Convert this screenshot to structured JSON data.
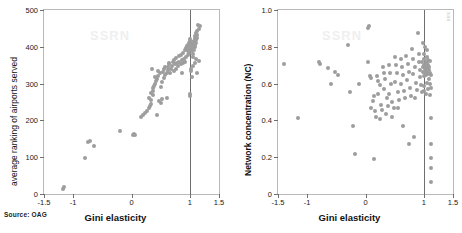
{
  "figure": {
    "source_note": "Source: OAG",
    "side_credit": "sas",
    "watermark_text": "SSRN"
  },
  "chart_data": [
    {
      "type": "scatter",
      "panel": "left",
      "title": "",
      "xlabel": "Gini elasticity",
      "ylabel": "average ranking of airports served",
      "xlim": [
        -1.5,
        1.5
      ],
      "ylim": [
        0,
        500
      ],
      "xticks": [
        -1.5,
        -1,
        0,
        1,
        1.5
      ],
      "xticklabels": [
        "-1.5",
        "-1",
        "0",
        "1",
        "1.5"
      ],
      "yticks": [
        0,
        100,
        200,
        300,
        400,
        500
      ],
      "yticklabels": [
        "0",
        "100",
        "200",
        "300",
        "400",
        "500"
      ],
      "grid": false,
      "legend": "none",
      "reference_line_x": 1,
      "marker_color": "#9d9d9d",
      "points": [
        [
          -1.18,
          14
        ],
        [
          -1.16,
          20
        ],
        [
          -0.8,
          98
        ],
        [
          -0.74,
          141
        ],
        [
          -0.71,
          143
        ],
        [
          -0.64,
          131
        ],
        [
          -0.2,
          171
        ],
        [
          0.02,
          160
        ],
        [
          0.04,
          163
        ],
        [
          0.06,
          159
        ],
        [
          0.16,
          209
        ],
        [
          0.2,
          215
        ],
        [
          0.23,
          219
        ],
        [
          0.27,
          226
        ],
        [
          0.3,
          233
        ],
        [
          0.31,
          240
        ],
        [
          0.33,
          245
        ],
        [
          0.3,
          262
        ],
        [
          0.34,
          256
        ],
        [
          0.36,
          268
        ],
        [
          0.33,
          275
        ],
        [
          0.36,
          281
        ],
        [
          0.37,
          289
        ],
        [
          0.35,
          341
        ],
        [
          0.38,
          293
        ],
        [
          0.4,
          300
        ],
        [
          0.42,
          306
        ],
        [
          0.44,
          312
        ],
        [
          0.41,
          318
        ],
        [
          0.46,
          322
        ],
        [
          0.45,
          333
        ],
        [
          0.48,
          328
        ],
        [
          0.43,
          215
        ],
        [
          0.47,
          252
        ],
        [
          0.5,
          246
        ],
        [
          0.52,
          258
        ],
        [
          0.5,
          290
        ],
        [
          0.53,
          303
        ],
        [
          0.55,
          316
        ],
        [
          0.54,
          332
        ],
        [
          0.56,
          340
        ],
        [
          0.58,
          323
        ],
        [
          0.6,
          329
        ],
        [
          0.57,
          346
        ],
        [
          0.62,
          336
        ],
        [
          0.63,
          345
        ],
        [
          0.6,
          262
        ],
        [
          0.64,
          352
        ],
        [
          0.66,
          330
        ],
        [
          0.68,
          339
        ],
        [
          0.65,
          356
        ],
        [
          0.7,
          347
        ],
        [
          0.72,
          333
        ],
        [
          0.71,
          360
        ],
        [
          0.74,
          352
        ],
        [
          0.76,
          341
        ],
        [
          0.73,
          365
        ],
        [
          0.78,
          356
        ],
        [
          0.8,
          348
        ],
        [
          0.77,
          370
        ],
        [
          0.82,
          360
        ],
        [
          0.84,
          352
        ],
        [
          0.81,
          374
        ],
        [
          0.86,
          364
        ],
        [
          0.88,
          356
        ],
        [
          0.85,
          379
        ],
        [
          0.9,
          368
        ],
        [
          0.87,
          330
        ],
        [
          0.92,
          360
        ],
        [
          0.89,
          384
        ],
        [
          0.94,
          372
        ],
        [
          0.91,
          390
        ],
        [
          0.96,
          377
        ],
        [
          0.93,
          396
        ],
        [
          0.98,
          382
        ],
        [
          0.95,
          401
        ],
        [
          0.97,
          388
        ],
        [
          0.99,
          394
        ],
        [
          0.96,
          406
        ],
        [
          1.0,
          399
        ],
        [
          0.98,
          411
        ],
        [
          1.01,
          403
        ],
        [
          1.0,
          416
        ],
        [
          1.02,
          408
        ],
        [
          1.01,
          421
        ],
        [
          1.03,
          412
        ],
        [
          1.02,
          333
        ],
        [
          1.03,
          317
        ],
        [
          1.0,
          273
        ],
        [
          1.01,
          265
        ],
        [
          1.04,
          396
        ],
        [
          1.05,
          402
        ],
        [
          1.03,
          388
        ],
        [
          1.06,
          380
        ],
        [
          1.05,
          372
        ],
        [
          1.07,
          392
        ],
        [
          1.04,
          405
        ],
        [
          1.08,
          399
        ],
        [
          1.06,
          410
        ],
        [
          1.09,
          404
        ],
        [
          1.07,
          417
        ],
        [
          1.1,
          411
        ],
        [
          1.08,
          424
        ],
        [
          1.11,
          418
        ],
        [
          1.09,
          430
        ],
        [
          1.12,
          425
        ],
        [
          1.1,
          437
        ],
        [
          1.13,
          432
        ],
        [
          1.12,
          443
        ],
        [
          1.15,
          449
        ],
        [
          1.17,
          456
        ],
        [
          1.14,
          460
        ],
        [
          1.13,
          330
        ],
        [
          1.16,
          362
        ],
        [
          1.11,
          366
        ],
        [
          1.08,
          356
        ],
        [
          1.05,
          347
        ],
        [
          1.02,
          339
        ]
      ]
    },
    {
      "type": "scatter",
      "panel": "right",
      "title": "",
      "xlabel": "Gini elasticity",
      "ylabel": "Network concentration (NC)",
      "xlim": [
        -1.5,
        1.5
      ],
      "ylim": [
        0,
        1.0
      ],
      "xticks": [
        -1.5,
        -1,
        0,
        1,
        1.5
      ],
      "xticklabels": [
        "-1.5",
        "-1",
        "0",
        "1",
        "1.5"
      ],
      "yticks": [
        0,
        0.2,
        0.4,
        0.6,
        0.8,
        1.0
      ],
      "yticklabels": [
        "0",
        "0.2",
        "0.4",
        "0.6",
        "0.8",
        "1.0"
      ],
      "grid": false,
      "legend": "none",
      "reference_line_x": 1,
      "marker_color": "#9d9d9d",
      "points": [
        [
          -1.4,
          0.705
        ],
        [
          -1.16,
          0.415
        ],
        [
          -0.8,
          0.72
        ],
        [
          -0.78,
          0.708
        ],
        [
          -0.64,
          0.685
        ],
        [
          -0.6,
          0.6
        ],
        [
          -0.52,
          0.665
        ],
        [
          -0.48,
          0.645
        ],
        [
          -0.3,
          0.81
        ],
        [
          -0.26,
          0.555
        ],
        [
          -0.22,
          0.37
        ],
        [
          -0.18,
          0.22
        ],
        [
          -0.12,
          0.6
        ],
        [
          0.05,
          0.9
        ],
        [
          0.06,
          0.915
        ],
        [
          0.04,
          0.72
        ],
        [
          0.08,
          0.64
        ],
        [
          0.1,
          0.63
        ],
        [
          0.12,
          0.505
        ],
        [
          0.14,
          0.53
        ],
        [
          0.1,
          0.47
        ],
        [
          0.16,
          0.45
        ],
        [
          0.18,
          0.42
        ],
        [
          0.15,
          0.19
        ],
        [
          0.2,
          0.64
        ],
        [
          0.22,
          0.615
        ],
        [
          0.24,
          0.59
        ],
        [
          0.21,
          0.545
        ],
        [
          0.26,
          0.485
        ],
        [
          0.28,
          0.455
        ],
        [
          0.25,
          0.41
        ],
        [
          0.3,
          0.69
        ],
        [
          0.32,
          0.66
        ],
        [
          0.34,
          0.625
        ],
        [
          0.31,
          0.57
        ],
        [
          0.36,
          0.52
        ],
        [
          0.38,
          0.48
        ],
        [
          0.35,
          0.435
        ],
        [
          0.4,
          0.7
        ],
        [
          0.42,
          0.655
        ],
        [
          0.44,
          0.6
        ],
        [
          0.41,
          0.545
        ],
        [
          0.46,
          0.5
        ],
        [
          0.48,
          0.465
        ],
        [
          0.45,
          0.42
        ],
        [
          0.5,
          0.745
        ],
        [
          0.52,
          0.7
        ],
        [
          0.54,
          0.66
        ],
        [
          0.51,
          0.61
        ],
        [
          0.56,
          0.555
        ],
        [
          0.58,
          0.51
        ],
        [
          0.55,
          0.47
        ],
        [
          0.6,
          0.735
        ],
        [
          0.62,
          0.69
        ],
        [
          0.64,
          0.645
        ],
        [
          0.61,
          0.6
        ],
        [
          0.66,
          0.56
        ],
        [
          0.68,
          0.52
        ],
        [
          0.65,
          0.37
        ],
        [
          0.7,
          0.75
        ],
        [
          0.72,
          0.705
        ],
        [
          0.74,
          0.665
        ],
        [
          0.71,
          0.62
        ],
        [
          0.76,
          0.575
        ],
        [
          0.78,
          0.535
        ],
        [
          0.75,
          0.27
        ],
        [
          0.8,
          0.79
        ],
        [
          0.82,
          0.735
        ],
        [
          0.84,
          0.69
        ],
        [
          0.81,
          0.65
        ],
        [
          0.86,
          0.605
        ],
        [
          0.88,
          0.565
        ],
        [
          0.85,
          0.52
        ],
        [
          0.83,
          0.31
        ],
        [
          0.9,
          0.875
        ],
        [
          0.91,
          0.76
        ],
        [
          0.92,
          0.715
        ],
        [
          0.94,
          0.675
        ],
        [
          0.93,
          0.635
        ],
        [
          0.95,
          0.595
        ],
        [
          0.96,
          0.555
        ],
        [
          0.97,
          0.715
        ],
        [
          0.98,
          0.69
        ],
        [
          0.99,
          0.665
        ],
        [
          1.0,
          0.64
        ],
        [
          1.0,
          0.76
        ],
        [
          1.01,
          0.735
        ],
        [
          1.01,
          0.7
        ],
        [
          1.02,
          0.68
        ],
        [
          1.02,
          0.655
        ],
        [
          1.03,
          0.72
        ],
        [
          1.03,
          0.695
        ],
        [
          1.04,
          0.67
        ],
        [
          1.04,
          0.645
        ],
        [
          1.05,
          0.745
        ],
        [
          1.05,
          0.71
        ],
        [
          1.06,
          0.685
        ],
        [
          1.06,
          0.66
        ],
        [
          1.07,
          0.73
        ],
        [
          1.07,
          0.7
        ],
        [
          1.08,
          0.675
        ],
        [
          1.08,
          0.65
        ],
        [
          1.0,
          0.585
        ],
        [
          1.01,
          0.56
        ],
        [
          1.03,
          0.545
        ],
        [
          1.05,
          0.605
        ],
        [
          1.07,
          0.57
        ],
        [
          1.09,
          0.69
        ],
        [
          1.1,
          0.66
        ],
        [
          1.09,
          0.625
        ],
        [
          1.11,
          0.6
        ],
        [
          1.12,
          0.645
        ],
        [
          1.13,
          0.575
        ],
        [
          1.1,
          0.54
        ],
        [
          1.12,
          0.415
        ],
        [
          1.12,
          0.27
        ],
        [
          1.12,
          0.195
        ],
        [
          1.12,
          0.14
        ],
        [
          1.12,
          0.065
        ],
        [
          0.98,
          0.82
        ],
        [
          1.02,
          0.8
        ],
        [
          1.06,
          0.78
        ],
        [
          1.1,
          0.725
        ]
      ]
    }
  ]
}
